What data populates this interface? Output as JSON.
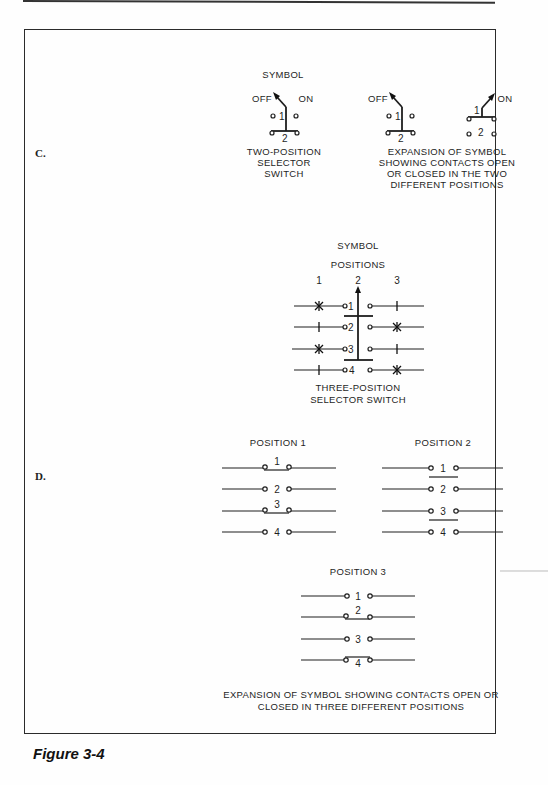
{
  "figure": {
    "label": "Figure 3-4",
    "sections": {
      "c": "C.",
      "d": "D."
    }
  },
  "two_position": {
    "symbol_title": "SYMBOL",
    "off_label": "OFF",
    "on_label": "ON",
    "contact_1": "1",
    "contact_2": "2",
    "caption_lines": [
      "TWO-POSITION",
      "SELECTOR",
      "SWITCH"
    ]
  },
  "two_position_expansion": {
    "off_label": "OFF",
    "on_label": "ON",
    "contact_1": "1",
    "contact_2": "2",
    "caption_lines": [
      "EXPANSION OF SYMBOL",
      "SHOWING CONTACTS OPEN",
      "OR CLOSED IN THE TWO",
      "DIFFERENT POSITIONS"
    ]
  },
  "three_position": {
    "symbol_title": "SYMBOL",
    "positions_title": "POSITIONS",
    "position_numbers": [
      "1",
      "2",
      "3"
    ],
    "contacts": [
      {
        "number": "1",
        "pos1": "closed",
        "pos3": "open"
      },
      {
        "number": "2",
        "pos1": "open",
        "pos3": "closed"
      },
      {
        "number": "3",
        "pos1": "closed",
        "pos3": "open"
      },
      {
        "number": "4",
        "pos1": "open",
        "pos3": "closed"
      }
    ],
    "caption_lines": [
      "THREE-POSITION",
      "SELECTOR SWITCH"
    ]
  },
  "position_views": [
    {
      "title": "POSITION 1",
      "contacts": [
        {
          "n": "1",
          "closed": true
        },
        {
          "n": "2",
          "closed": false
        },
        {
          "n": "3",
          "closed": true
        },
        {
          "n": "4",
          "closed": false
        }
      ]
    },
    {
      "title": "POSITION 2",
      "contacts": [
        {
          "n": "1",
          "closed": true
        },
        {
          "n": "2",
          "closed": false
        },
        {
          "n": "3",
          "closed": true
        },
        {
          "n": "4",
          "closed": false
        }
      ]
    },
    {
      "title": "POSITION 3",
      "contacts": [
        {
          "n": "1",
          "closed": false
        },
        {
          "n": "2",
          "closed": true
        },
        {
          "n": "3",
          "closed": false
        },
        {
          "n": "4",
          "closed": true
        }
      ]
    }
  ],
  "bottom_caption_lines": [
    "EXPANSION OF SYMBOL SHOWING CONTACTS OPEN OR",
    "CLOSED IN THREE DIFFERENT POSITIONS"
  ]
}
